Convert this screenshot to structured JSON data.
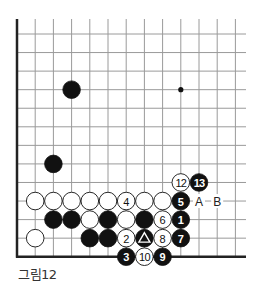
{
  "caption": "그림12",
  "board": {
    "columns": 13,
    "rows": 13,
    "origin_x": 17,
    "origin_y": 34,
    "spacing_x": 18.2,
    "spacing_y": 18.56,
    "top_extent_y": 19,
    "right_extent_x": 246,
    "edges": [
      "left",
      "bottom"
    ],
    "line_color": "#9a9a9a",
    "edge_color": "#222222",
    "stone_radius": 8.8
  },
  "star_points": [
    {
      "col": 9,
      "row": 3
    }
  ],
  "stones": [
    {
      "col": 3,
      "row": 3,
      "color": "black",
      "label": ""
    },
    {
      "col": 2,
      "row": 7,
      "color": "black",
      "label": ""
    },
    {
      "col": 9,
      "row": 8,
      "color": "white",
      "label": "12"
    },
    {
      "col": 10,
      "row": 8,
      "color": "black",
      "label": "13"
    },
    {
      "col": 1,
      "row": 9,
      "color": "white",
      "label": ""
    },
    {
      "col": 2,
      "row": 9,
      "color": "white",
      "label": ""
    },
    {
      "col": 3,
      "row": 9,
      "color": "white",
      "label": ""
    },
    {
      "col": 4,
      "row": 9,
      "color": "white",
      "label": ""
    },
    {
      "col": 5,
      "row": 9,
      "color": "white",
      "label": ""
    },
    {
      "col": 6,
      "row": 9,
      "color": "white",
      "label": "4"
    },
    {
      "col": 7,
      "row": 9,
      "color": "white",
      "label": ""
    },
    {
      "col": 8,
      "row": 9,
      "color": "white",
      "label": ""
    },
    {
      "col": 9,
      "row": 9,
      "color": "black",
      "label": "5"
    },
    {
      "col": 2,
      "row": 10,
      "color": "black",
      "label": ""
    },
    {
      "col": 3,
      "row": 10,
      "color": "black",
      "label": ""
    },
    {
      "col": 4,
      "row": 10,
      "color": "white",
      "label": ""
    },
    {
      "col": 5,
      "row": 10,
      "color": "black",
      "label": ""
    },
    {
      "col": 6,
      "row": 10,
      "color": "white",
      "label": ""
    },
    {
      "col": 7,
      "row": 10,
      "color": "black",
      "label": ""
    },
    {
      "col": 8,
      "row": 10,
      "color": "white",
      "label": "6"
    },
    {
      "col": 9,
      "row": 10,
      "color": "black",
      "label": "1"
    },
    {
      "col": 1,
      "row": 11,
      "color": "white",
      "label": ""
    },
    {
      "col": 4,
      "row": 11,
      "color": "black",
      "label": ""
    },
    {
      "col": 5,
      "row": 11,
      "color": "black",
      "label": ""
    },
    {
      "col": 6,
      "row": 11,
      "color": "white",
      "label": "2"
    },
    {
      "col": 7,
      "row": 11,
      "color": "black",
      "label": "△"
    },
    {
      "col": 8,
      "row": 11,
      "color": "white",
      "label": "8"
    },
    {
      "col": 9,
      "row": 11,
      "color": "black",
      "label": "7"
    },
    {
      "col": 6,
      "row": 12,
      "color": "black",
      "label": "3"
    },
    {
      "col": 7,
      "row": 12,
      "color": "white",
      "label": "10"
    },
    {
      "col": 8,
      "row": 12,
      "color": "black",
      "label": "9"
    }
  ],
  "markers": [
    {
      "col": 10,
      "row": 9,
      "label": "A"
    },
    {
      "col": 11,
      "row": 9,
      "label": "B"
    }
  ]
}
